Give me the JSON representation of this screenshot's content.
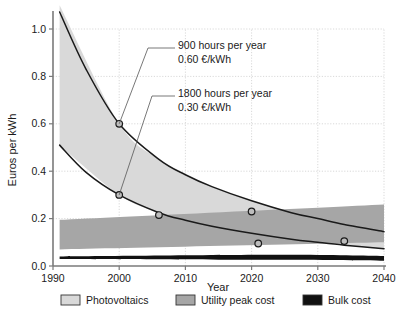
{
  "chart_data": {
    "type": "line",
    "title": "",
    "xlabel": "Year",
    "ylabel": "Euros per kWh",
    "xlim": [
      1990,
      2040
    ],
    "ylim": [
      0.0,
      1.0
    ],
    "grid": true,
    "x_ticks": [
      1990,
      2000,
      2010,
      2020,
      2030,
      2040
    ],
    "x_tick_labels": [
      "1990",
      "2000",
      "2010",
      "2020",
      "2030",
      "2040"
    ],
    "y_ticks": [
      0.0,
      0.2,
      0.4,
      0.6,
      0.8,
      1.0
    ],
    "y_tick_labels": [
      "0.0",
      "0.2",
      "0.4",
      "0.6",
      "0.8",
      "1.0"
    ],
    "legend_position": "bottom",
    "series": [
      {
        "name": "900 hours per year",
        "type": "line",
        "x": [
          1991,
          1995,
          2000,
          2006,
          2010,
          2014,
          2020,
          2026,
          2030,
          2034,
          2040
        ],
        "values": [
          1.1,
          0.83,
          0.6,
          0.45,
          0.385,
          0.335,
          0.275,
          0.225,
          0.2,
          0.175,
          0.145
        ]
      },
      {
        "name": "1800 hours per year",
        "type": "line",
        "x": [
          1991,
          1995,
          2000,
          2006,
          2010,
          2014,
          2020,
          2026,
          2030,
          2034,
          2040
        ],
        "values": [
          0.51,
          0.395,
          0.3,
          0.225,
          0.193,
          0.168,
          0.138,
          0.113,
          0.1,
          0.088,
          0.073
        ]
      },
      {
        "name": "Photovoltaics",
        "type": "band",
        "x": [
          1991,
          2000,
          2006,
          2010,
          2014,
          2020,
          2026,
          2030,
          2034,
          2040
        ],
        "upper": [
          1.1,
          0.6,
          0.45,
          0.385,
          0.335,
          0.275,
          0.225,
          0.2,
          0.175,
          0.145
        ],
        "lower": [
          0.51,
          0.3,
          0.225,
          0.193,
          0.168,
          0.138,
          0.113,
          0.1,
          0.088,
          0.073
        ]
      },
      {
        "name": "Utility peak cost",
        "type": "band",
        "x": [
          1991,
          2040
        ],
        "upper": [
          0.195,
          0.26
        ],
        "lower": [
          0.07,
          0.1
        ]
      },
      {
        "name": "Bulk cost",
        "type": "band",
        "x": [
          1991,
          2024,
          2040
        ],
        "upper": [
          0.04,
          0.047,
          0.042
        ],
        "lower": [
          0.03,
          0.026,
          0.022
        ]
      }
    ],
    "markers": [
      {
        "x": 2000,
        "y": 0.6,
        "series": "900 hours per year"
      },
      {
        "x": 2000,
        "y": 0.3,
        "series": "1800 hours per year"
      },
      {
        "x": 2006,
        "y": 0.215,
        "series": "1800 hours per year"
      },
      {
        "x": 2020,
        "y": 0.23,
        "series": "900 hours per year"
      },
      {
        "x": 2021,
        "y": 0.095,
        "series": "1800 hours per year"
      },
      {
        "x": 2034,
        "y": 0.105,
        "series": "900 hours per year"
      }
    ],
    "annotations": [
      {
        "id": "annot-900",
        "line1": "900 hours per year",
        "line2": "0.60 €/kWh",
        "points_to": {
          "x": 2000,
          "y": 0.6
        }
      },
      {
        "id": "annot-1800",
        "line1": "1800 hours per year",
        "line2": "0.30 €/kWh",
        "points_to": {
          "x": 2000,
          "y": 0.3
        }
      }
    ],
    "legend": [
      {
        "label": "Photovoltaics",
        "color": "#d9d9d9"
      },
      {
        "label": "Utility peak cost",
        "color": "#a6a6a6"
      },
      {
        "label": "Bulk cost",
        "color": "#111111"
      }
    ],
    "colors": {
      "photovoltaics": "#d9d9d9",
      "utility_peak_cost": "#a6a6a6",
      "bulk_cost": "#111111",
      "curve": "#1a1a1a",
      "grid": "#c8c8c8",
      "axis": "#7a7a7a",
      "marker_fill": "#bdbdbd",
      "background": "#ffffff"
    }
  }
}
